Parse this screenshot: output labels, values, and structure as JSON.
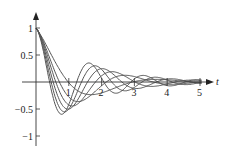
{
  "chart_data": {
    "type": "line",
    "title": "",
    "xlabel": "t",
    "ylabel": "",
    "xlim": [
      0,
      5.3
    ],
    "ylim": [
      -1.1,
      1.15
    ],
    "x_ticks": [
      1,
      2,
      3,
      4,
      5
    ],
    "x_tick_labels": [
      "1",
      "2",
      "3",
      "4",
      "5"
    ],
    "y_ticks": [
      1,
      0.5,
      -0.5,
      -1
    ],
    "y_tick_labels": [
      "1",
      "0.5",
      "−0.5",
      "−1"
    ],
    "grid": false,
    "legend": null,
    "series": [
      {
        "name": "curve-1",
        "damping": 0.8,
        "omega": 1.6
      },
      {
        "name": "curve-2",
        "damping": 0.75,
        "omega": 2.2
      },
      {
        "name": "curve-3",
        "damping": 0.7,
        "omega": 2.6
      },
      {
        "name": "curve-4",
        "damping": 0.68,
        "omega": 3.0
      },
      {
        "name": "curve-5",
        "damping": 0.66,
        "omega": 3.4
      },
      {
        "name": "curve-6",
        "damping": 0.64,
        "omega": 3.8
      }
    ]
  },
  "style": {
    "line_color": "#555555",
    "axis_color": "#333333"
  }
}
